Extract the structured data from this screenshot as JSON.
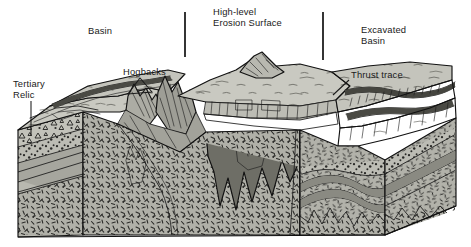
{
  "figure": {
    "width": 471,
    "height": 247,
    "background": "#ffffff"
  },
  "labels": [
    {
      "id": "basin",
      "text": "Basin",
      "x": 88,
      "y": 34
    },
    {
      "id": "high-level",
      "text": "High-level",
      "x": 213,
      "y": 15
    },
    {
      "id": "erosion-surface",
      "text": "Erosion Surface",
      "x": 213,
      "y": 26
    },
    {
      "id": "excavated",
      "text": "Excavated",
      "x": 361,
      "y": 33
    },
    {
      "id": "excavated-basin",
      "text": "Basin",
      "x": 361,
      "y": 44
    },
    {
      "id": "tertiary",
      "text": "Tertiary",
      "x": 13,
      "y": 87
    },
    {
      "id": "tertiary-relic",
      "text": "Relic",
      "x": 13,
      "y": 98
    },
    {
      "id": "hogbacks",
      "text": "Hogbacks",
      "x": 123,
      "y": 75
    },
    {
      "id": "thrust-trace",
      "text": "Thrust trace",
      "x": 351,
      "y": 78
    }
  ],
  "ticks": [
    {
      "id": "tick-left",
      "x": 185,
      "y1": 12,
      "y2": 57
    },
    {
      "id": "tick-right",
      "x": 323,
      "y1": 12,
      "y2": 60
    }
  ],
  "leaders": [
    {
      "id": "leader-tertiary",
      "path": "M 31 101 L 31 136"
    },
    {
      "id": "leader-hogbacks-a",
      "path": "M 140 78 L 128 94 L 152 92 Z"
    },
    {
      "id": "leader-thrust-trace",
      "path": "M 349 80 L 333 95"
    }
  ],
  "colors": {
    "ink": "#1a1a1a",
    "surface_light": "#c9c9c1",
    "surface_mid": "#b4b4ac",
    "face_grey": "#a8a8a0",
    "face_dark": "#8e8e86",
    "basement_grey": "#b0b0a8",
    "intrusion_dark": "#6f6f68",
    "paper": "#ffffff"
  },
  "units": [
    {
      "id": "tertiary-conglomerate",
      "pattern": "triangles",
      "description": "Tertiary relic conglomerate with angular clasts"
    },
    {
      "id": "pebble-bed",
      "pattern": "dots",
      "description": "Pebbly / conglomeratic bed"
    },
    {
      "id": "dipping-strata",
      "pattern": "lines",
      "description": "Dipping sedimentary strata"
    },
    {
      "id": "basement",
      "pattern": "dashes",
      "description": "Crystalline basement, dash stipple"
    },
    {
      "id": "cleaved-core",
      "pattern": "solid",
      "description": "Dark cleaved / intruded core"
    },
    {
      "id": "folded-strata",
      "pattern": "lines",
      "description": "Folded strata in excavated basin"
    }
  ]
}
